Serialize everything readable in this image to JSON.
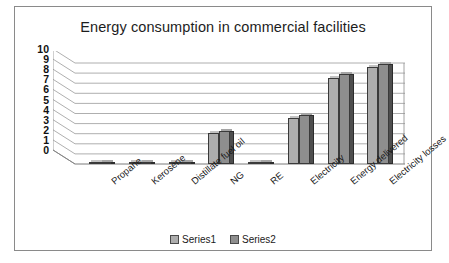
{
  "chart_data": {
    "type": "bar",
    "title": "Energy consumption in commercial facilities",
    "xlabel": "",
    "ylabel": "",
    "ylim": [
      0,
      10
    ],
    "yticks": [
      10,
      9,
      8,
      7,
      6,
      5,
      4,
      3,
      2,
      1,
      0
    ],
    "grid": true,
    "legend_position": "bottom",
    "style": "3d-clustered-column",
    "categories": [
      "Propane",
      "Kerosene",
      "Distillate fuel oil",
      "NG",
      "RE",
      "Electricity",
      "Energy delivered",
      "Electricity losses"
    ],
    "series": [
      {
        "name": "Series1",
        "color": "#adadad",
        "values": [
          0.12,
          0.08,
          0.18,
          3.1,
          0.1,
          4.6,
          8.5,
          9.6
        ]
      },
      {
        "name": "Series2",
        "color": "#8e8e8e",
        "values": [
          0.14,
          0.09,
          0.2,
          3.3,
          0.11,
          4.9,
          8.9,
          9.9
        ]
      }
    ]
  },
  "legend": {
    "items": [
      {
        "label": "Series1",
        "color": "#adadad"
      },
      {
        "label": "Series2",
        "color": "#8e8e8e"
      }
    ]
  }
}
